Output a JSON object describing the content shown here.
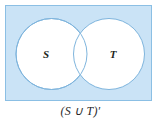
{
  "figure": {
    "type": "venn-diagram",
    "title": "",
    "caption": "(S ∪ T)′",
    "universe": {
      "name": "universal-set-rectangle",
      "shaded": true,
      "fill_color": "#cae3f6",
      "border_color": "#8bbfe4",
      "x": 5,
      "y": 5,
      "width": 147,
      "height": 96
    },
    "sets": [
      {
        "label": "S",
        "name": "set-s-circle",
        "shaded": false,
        "fill_color": "#ffffff",
        "stroke_color": "#7fb5dd",
        "cx": 51.5,
        "cy": 54,
        "r": 35.5,
        "label_x": 46,
        "label_y": 58
      },
      {
        "label": "T",
        "name": "set-t-circle",
        "shaded": false,
        "fill_color": "#ffffff",
        "stroke_color": "#7fb5dd",
        "cx": 109,
        "cy": 54,
        "r": 35.5,
        "label_x": 113,
        "label_y": 58
      }
    ],
    "shaded_region_description": "complement of S union T",
    "colors": {
      "shade": "#cae3f6",
      "circle_stroke": "#7fb5dd",
      "rect_border": "#8bbfe4",
      "text": "#231f20",
      "background": "#ffffff"
    }
  }
}
